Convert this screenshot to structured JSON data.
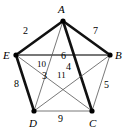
{
  "figure": {
    "name": "weighted-complete-graph-k5",
    "background": "#ffffff",
    "width": 126,
    "height": 133
  },
  "colors": {
    "outline": "#000000",
    "bold_edge": "#111111",
    "thin_edge": "#555555",
    "gray_edge": "#777777",
    "text": "#000000"
  },
  "vertices": [
    {
      "id": "A",
      "label": "A",
      "x": 63,
      "y": 21,
      "label_x": 58,
      "label_y": 4
    },
    {
      "id": "B",
      "label": "B",
      "x": 110,
      "y": 55,
      "label_x": 115,
      "label_y": 50
    },
    {
      "id": "C",
      "label": "C",
      "x": 92,
      "y": 111,
      "label_x": 89,
      "label_y": 118
    },
    {
      "id": "D",
      "label": "D",
      "x": 34,
      "y": 111,
      "label_x": 29,
      "label_y": 118
    },
    {
      "id": "E",
      "label": "E",
      "x": 16,
      "y": 55,
      "label_x": 3,
      "label_y": 50
    }
  ],
  "edges": [
    {
      "from": "A",
      "to": "E",
      "weight": "2",
      "style": "bold",
      "label_x": 23,
      "label_y": 26
    },
    {
      "from": "A",
      "to": "B",
      "weight": "7",
      "style": "bold",
      "label_x": 93,
      "label_y": 26
    },
    {
      "from": "B",
      "to": "C",
      "weight": "5",
      "style": "thin",
      "label_x": 104,
      "label_y": 80
    },
    {
      "from": "C",
      "to": "D",
      "weight": "9",
      "style": "thin",
      "label_x": 58,
      "label_y": 114
    },
    {
      "from": "D",
      "to": "E",
      "weight": "8",
      "style": "bold",
      "label_x": 14,
      "label_y": 79
    },
    {
      "from": "E",
      "to": "B",
      "weight": "6",
      "style": "gray",
      "label_x": 61,
      "label_y": 51
    },
    {
      "from": "A",
      "to": "D",
      "weight": "10",
      "style": "thin",
      "label_x": 37,
      "label_y": 60
    },
    {
      "from": "A",
      "to": "C",
      "weight": "4",
      "style": "bold",
      "label_x": 66,
      "label_y": 62
    },
    {
      "from": "E",
      "to": "C",
      "weight": "3",
      "style": "thin",
      "label_x": 42,
      "label_y": 71
    },
    {
      "from": "D",
      "to": "B",
      "weight": "11",
      "style": "thin",
      "label_x": 57,
      "label_y": 71
    }
  ],
  "caption": {
    "title": "Complete graph K5 with weighted edges"
  }
}
